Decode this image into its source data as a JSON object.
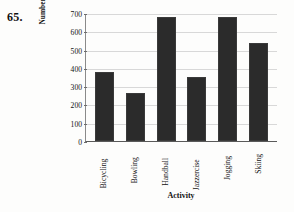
{
  "problem": {
    "number": "65."
  },
  "chart_data": {
    "type": "bar",
    "title": "",
    "xlabel": "Activity",
    "ylabel_line1": "Number of calories burned",
    "ylabel_line2": "in one hour",
    "categories": [
      "Bicycling",
      "Bowling",
      "Handball",
      "Jazzercise",
      "Jogging",
      "Skiing"
    ],
    "values": [
      380,
      265,
      680,
      350,
      680,
      535
    ],
    "ylim": [
      0,
      700
    ],
    "yticks": [
      0,
      100,
      200,
      300,
      400,
      500,
      600,
      700
    ],
    "ytick_labels": [
      "0",
      "100",
      "200",
      "300",
      "400",
      "500",
      "600",
      "700"
    ],
    "grid": true,
    "legend": "none",
    "bar_color": "#2b2b2b",
    "grid_color": "#d8d8d8",
    "axis_color": "#5a5a5a"
  }
}
